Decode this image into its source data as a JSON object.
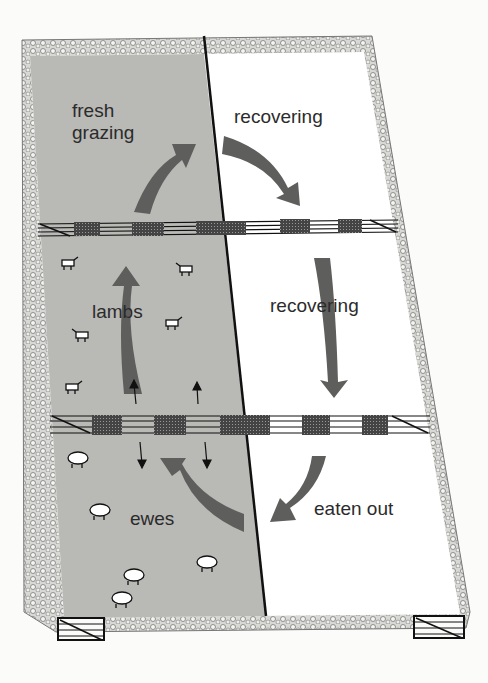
{
  "diagram": {
    "labels": {
      "fresh_grazing": "fresh\ngrazing",
      "recovering_top": "recovering",
      "recovering_mid": "recovering",
      "lambs": "lambs",
      "ewes": "ewes",
      "eaten_out": "eaten out"
    },
    "colors": {
      "grazed_area": "#b9b9b6",
      "ungrazed_area": "#ffffff",
      "arrow": "#5e5e5c",
      "fence": "#1a1a1a",
      "wall": "#8a8a86",
      "text": "#2b2b2b"
    },
    "paddocks": [
      {
        "position": "top-left",
        "state": "fresh grazing",
        "shaded": true
      },
      {
        "position": "top-right",
        "state": "recovering",
        "shaded": false
      },
      {
        "position": "middle-left",
        "state": "lambs",
        "shaded": true
      },
      {
        "position": "middle-right",
        "state": "recovering",
        "shaded": false
      },
      {
        "position": "bottom-left",
        "state": "ewes",
        "shaded": true
      },
      {
        "position": "bottom-right",
        "state": "eaten out",
        "shaded": false
      }
    ],
    "animals": {
      "lambs_count": 6,
      "ewes_count": 6
    }
  }
}
